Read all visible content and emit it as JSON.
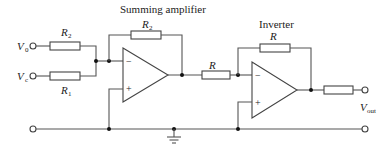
{
  "diagram": {
    "labels": {
      "summing_amplifier": "Summing amplifier",
      "inverter": "Inverter",
      "v0": {
        "main": "V",
        "sub": "0"
      },
      "vc": {
        "main": "V",
        "sub": "c"
      },
      "vout": {
        "main": "V",
        "sub": "out"
      },
      "r2_input": {
        "main": "R",
        "sub": "2"
      },
      "r1_input": {
        "main": "R",
        "sub": "1"
      },
      "r2_feedback": {
        "main": "R",
        "sub": "2"
      },
      "r_series": "R",
      "r_feedback_inverter": "R",
      "minus_1": "−",
      "plus_1": "+",
      "minus_2": "−",
      "plus_2": "+"
    },
    "colors": {
      "line": "#555555",
      "text": "#222222",
      "background": "#ffffff"
    }
  }
}
